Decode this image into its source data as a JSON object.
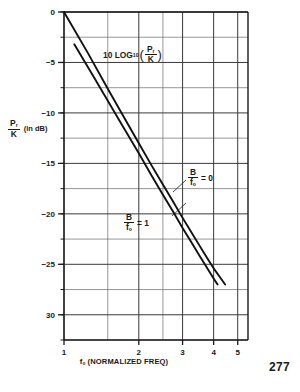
{
  "chart_data": {
    "type": "line",
    "title": "",
    "annotation": {
      "prefix": "10 LOG",
      "base": "10",
      "open_paren": "(",
      "numerator": "P",
      "numerator_sub": "r",
      "denominator": "K",
      "close_paren": ")"
    },
    "xlabel": "f₀ (NORMALIZED FREQ)",
    "xlabel_main": "f",
    "xlabel_sub": "o",
    "xlabel_rest": " (NORMALIZED FREQ)",
    "ylabel_numerator": "P",
    "ylabel_numerator_sub": "r",
    "ylabel_denominator": "K",
    "ylabel_unit": "(in dB)",
    "xscale": "log",
    "xlim": [
      1,
      5.5
    ],
    "ylim": [
      -32.5,
      0
    ],
    "xticks": [
      1,
      2,
      3,
      4,
      5
    ],
    "xtick_labels": [
      "1",
      "2",
      "3",
      "4",
      "5"
    ],
    "yticks": [
      0,
      -5,
      -10,
      -15,
      -20,
      -25,
      -30
    ],
    "ytick_labels": [
      "0",
      "−5",
      "−10",
      "−15",
      "−20",
      "−25",
      "30"
    ],
    "yminor_step": 2.5,
    "grid": true,
    "legend_position": "inline-annotations",
    "series": [
      {
        "name": "B/f0 = 0",
        "label_numerator": "B",
        "label_denominator": "f",
        "label_denominator_sub": "o",
        "label_value": "= 0",
        "points": [
          [
            1.0,
            0.0
          ],
          [
            1.25,
            -4.1
          ],
          [
            1.5,
            -7.6
          ],
          [
            1.75,
            -10.5
          ],
          [
            2.0,
            -13.0
          ],
          [
            2.25,
            -15.2
          ],
          [
            2.5,
            -17.1
          ],
          [
            2.75,
            -18.8
          ],
          [
            3.0,
            -20.4
          ],
          [
            3.25,
            -21.8
          ],
          [
            3.5,
            -23.1
          ],
          [
            3.75,
            -24.3
          ],
          [
            4.0,
            -25.4
          ],
          [
            4.25,
            -26.3
          ],
          [
            4.45,
            -27.0
          ]
        ]
      },
      {
        "name": "B/f0 = 1",
        "label_numerator": "B",
        "label_denominator": "f",
        "label_denominator_sub": "o",
        "label_value": "= 1",
        "points": [
          [
            1.1,
            -3.2
          ],
          [
            1.3,
            -6.2
          ],
          [
            1.5,
            -8.8
          ],
          [
            1.75,
            -11.6
          ],
          [
            2.0,
            -14.0
          ],
          [
            2.25,
            -16.2
          ],
          [
            2.5,
            -18.1
          ],
          [
            2.75,
            -19.8
          ],
          [
            3.0,
            -21.4
          ],
          [
            3.25,
            -22.8
          ],
          [
            3.5,
            -24.1
          ],
          [
            3.75,
            -25.3
          ],
          [
            4.0,
            -26.4
          ],
          [
            4.15,
            -27.0
          ]
        ]
      }
    ]
  },
  "page": {
    "number": "277"
  },
  "colors": {
    "ink": "#1a1a1a",
    "grid": "#555555",
    "curve": "#111111",
    "background": "#ffffff"
  }
}
